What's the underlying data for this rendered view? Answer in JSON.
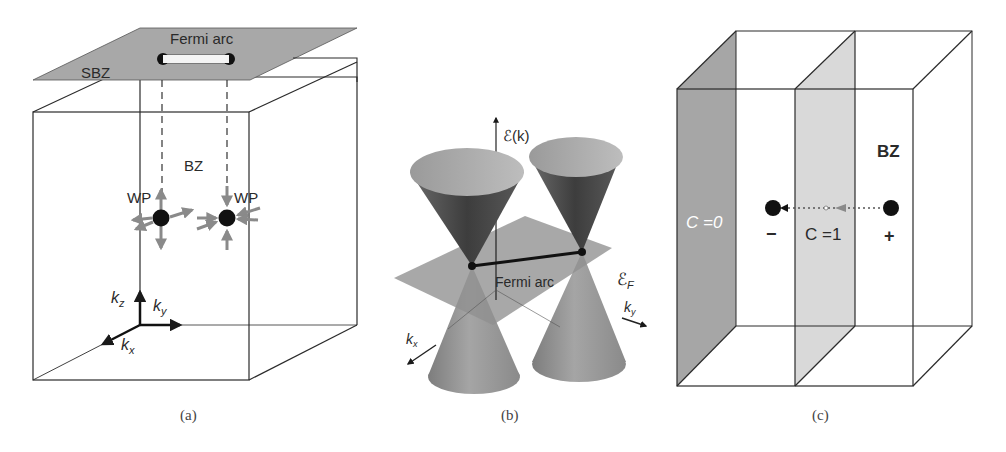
{
  "figure": {
    "panels": [
      {
        "id": "a",
        "caption": "(a)",
        "labels": {
          "fermi_arc": "Fermi arc",
          "sbz": "SBZ",
          "bz": "BZ",
          "wp_left": "WP",
          "wp_right": "WP",
          "kz": "k",
          "kz_sub": "z",
          "ky": "k",
          "ky_sub": "y",
          "kx": "k",
          "kx_sub": "x"
        }
      },
      {
        "id": "b",
        "caption": "(b)",
        "labels": {
          "energy_axis": "ℰ(k)",
          "fermi_level": "ℰ",
          "fermi_level_sub": "F",
          "fermi_arc": "Fermi arc",
          "kx": "k",
          "kx_sub": "x",
          "ky": "k",
          "ky_sub": "y"
        }
      },
      {
        "id": "c",
        "caption": "(c)",
        "labels": {
          "bz": "BZ",
          "chern_zero": "C =0",
          "chern_one": "C =1",
          "minus": "−",
          "plus": "+"
        }
      }
    ],
    "colors": {
      "line": "#2b2b2b",
      "plane_gray": "#a8a8a8",
      "arrow_gray": "#8a8a8a",
      "cone_dark": "#4a4a4a",
      "cone_light": "#9a9a9a",
      "slab_dark": "#a6a6a6",
      "slab_light": "#d9d9d9"
    }
  }
}
